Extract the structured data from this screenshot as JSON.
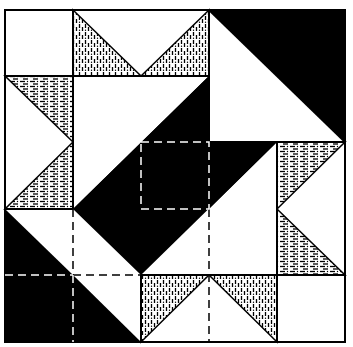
{
  "diagram": {
    "colors": {
      "background": "#ffffff",
      "dark": "#000000",
      "light": "#ffffff",
      "outline": "#000000"
    },
    "grid": {
      "cols": 5,
      "rows": 5,
      "x": [
        5,
        73,
        141,
        209,
        277,
        345
      ],
      "y": [
        10,
        76,
        142,
        209,
        275,
        342
      ]
    },
    "patterns": {
      "vertical_hatch": "textured fabric with vertical dash marks",
      "horizontal_hatch": "textured fabric with horizontal dash marks"
    }
  }
}
